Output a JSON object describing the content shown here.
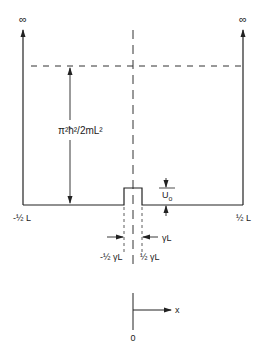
{
  "diagram": {
    "labels": {
      "infinity_left": "∞",
      "infinity_right": "∞",
      "energy_level": "π²ħ²/2mL²",
      "barrier_height": "U",
      "barrier_height_sub": "o",
      "left_wall": "-½ L",
      "right_wall": "½ L",
      "barrier_width": "γL",
      "barrier_left_edge": "-½ γL",
      "barrier_right_edge": "½ γL",
      "axis_x": "x",
      "axis_origin": "0"
    },
    "colors": {
      "line": "#222222",
      "dashed": "#333333",
      "background": "#ffffff"
    }
  }
}
